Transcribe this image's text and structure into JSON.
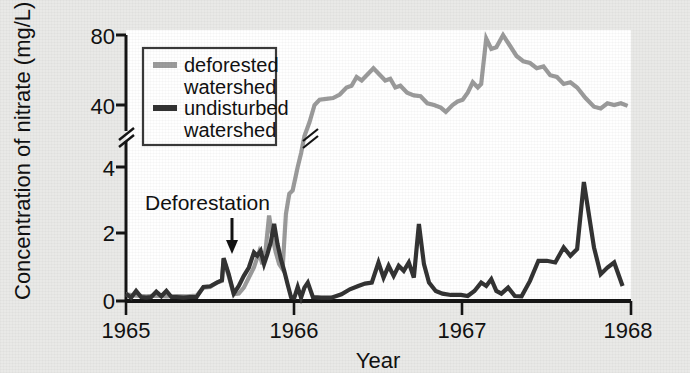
{
  "chart_data": {
    "type": "line",
    "title": "",
    "xlabel": "Year",
    "ylabel": "Concentration of nitrate (mg/L)",
    "xlim": [
      1965,
      1968
    ],
    "xticks": [
      1965,
      1966,
      1967,
      1968
    ],
    "xticklabels": [
      "1965",
      "1966",
      "1967",
      "1968"
    ],
    "yticks_lower": [
      0,
      2,
      4
    ],
    "yticklabels_lower": [
      "0",
      "2",
      "4"
    ],
    "yticks_upper": [
      40,
      80
    ],
    "yticklabels_upper": [
      "40",
      "80"
    ],
    "y_axis_break": true,
    "y_break_note": "axis broken between 4 and 40 mg/L",
    "grid": false,
    "legend_position": "upper-left-inside",
    "annotations": [
      {
        "text": "Deforestation",
        "x": 1965.58,
        "y": 2.85,
        "arrow_to_x": 1965.6,
        "arrow_to_y": 1.3
      }
    ],
    "series": [
      {
        "name": "deforested watershed",
        "color": "#9b9b9b",
        "legend_label_line1": "deforested",
        "legend_label_line2": "watershed",
        "points": [
          [
            1965.0,
            0.2
          ],
          [
            1965.06,
            0.16
          ],
          [
            1965.12,
            0.14
          ],
          [
            1965.18,
            0.16
          ],
          [
            1965.24,
            0.14
          ],
          [
            1965.3,
            0.15
          ],
          [
            1965.36,
            0.14
          ],
          [
            1965.42,
            0.16
          ],
          [
            1965.46,
            0.4
          ],
          [
            1965.5,
            0.42
          ],
          [
            1965.54,
            0.55
          ],
          [
            1965.57,
            0.6
          ],
          [
            1965.58,
            1.25
          ],
          [
            1965.61,
            0.75
          ],
          [
            1965.64,
            0.2
          ],
          [
            1965.67,
            0.22
          ],
          [
            1965.7,
            0.4
          ],
          [
            1965.73,
            0.7
          ],
          [
            1965.76,
            1.0
          ],
          [
            1965.79,
            1.45
          ],
          [
            1965.81,
            1.1
          ],
          [
            1965.83,
            1.55
          ],
          [
            1965.85,
            2.55
          ],
          [
            1965.87,
            1.9
          ],
          [
            1965.89,
            1.45
          ],
          [
            1965.91,
            1.1
          ],
          [
            1965.93,
            0.95
          ],
          [
            1965.95,
            2.6
          ],
          [
            1965.97,
            3.2
          ],
          [
            1965.99,
            3.3
          ],
          [
            1966.02,
            4.0
          ],
          [
            1966.04,
            12.0
          ],
          [
            1966.06,
            22.0
          ],
          [
            1966.09,
            30.0
          ],
          [
            1966.12,
            40.0
          ],
          [
            1966.15,
            43.0
          ],
          [
            1966.19,
            43.5
          ],
          [
            1966.23,
            44.0
          ],
          [
            1966.27,
            46.0
          ],
          [
            1966.31,
            50.0
          ],
          [
            1966.34,
            51.0
          ],
          [
            1966.37,
            56.0
          ],
          [
            1966.4,
            54.0
          ],
          [
            1966.44,
            58.0
          ],
          [
            1966.47,
            61.0
          ],
          [
            1966.51,
            57.0
          ],
          [
            1966.54,
            54.0
          ],
          [
            1966.57,
            55.0
          ],
          [
            1966.6,
            50.0
          ],
          [
            1966.63,
            51.0
          ],
          [
            1966.67,
            47.0
          ],
          [
            1966.71,
            45.5
          ],
          [
            1966.75,
            45.0
          ],
          [
            1966.79,
            41.0
          ],
          [
            1966.83,
            40.0
          ],
          [
            1966.87,
            38.5
          ],
          [
            1966.9,
            36.0
          ],
          [
            1966.94,
            40.0
          ],
          [
            1966.97,
            42.0
          ],
          [
            1967.0,
            43.0
          ],
          [
            1967.03,
            47.0
          ],
          [
            1967.06,
            53.0
          ],
          [
            1967.09,
            50.0
          ],
          [
            1967.11,
            52.0
          ],
          [
            1967.14,
            78.0
          ],
          [
            1967.17,
            72.0
          ],
          [
            1967.2,
            73.0
          ],
          [
            1967.24,
            80.0
          ],
          [
            1967.28,
            74.0
          ],
          [
            1967.32,
            68.0
          ],
          [
            1967.36,
            65.0
          ],
          [
            1967.4,
            64.0
          ],
          [
            1967.44,
            61.0
          ],
          [
            1967.48,
            62.0
          ],
          [
            1967.52,
            57.0
          ],
          [
            1967.56,
            56.0
          ],
          [
            1967.6,
            52.0
          ],
          [
            1967.64,
            53.0
          ],
          [
            1967.68,
            50.0
          ],
          [
            1967.73,
            44.0
          ],
          [
            1967.78,
            39.0
          ],
          [
            1967.82,
            38.0
          ],
          [
            1967.86,
            41.0
          ],
          [
            1967.9,
            40.0
          ],
          [
            1967.94,
            41.0
          ],
          [
            1967.98,
            39.5
          ]
        ]
      },
      {
        "name": "undisturbed watershed",
        "color": "#333333",
        "legend_label_line1": "undisturbed",
        "legend_label_line2": "watershed",
        "points": [
          [
            1965.0,
            0.22
          ],
          [
            1965.03,
            0.1
          ],
          [
            1965.06,
            0.3
          ],
          [
            1965.09,
            0.12
          ],
          [
            1965.12,
            0.1
          ],
          [
            1965.15,
            0.12
          ],
          [
            1965.18,
            0.28
          ],
          [
            1965.21,
            0.14
          ],
          [
            1965.24,
            0.3
          ],
          [
            1965.27,
            0.12
          ],
          [
            1965.3,
            0.12
          ],
          [
            1965.34,
            0.1
          ],
          [
            1965.38,
            0.12
          ],
          [
            1965.42,
            0.12
          ],
          [
            1965.46,
            0.42
          ],
          [
            1965.5,
            0.44
          ],
          [
            1965.54,
            0.55
          ],
          [
            1965.57,
            0.62
          ],
          [
            1965.58,
            1.28
          ],
          [
            1965.61,
            0.8
          ],
          [
            1965.64,
            0.22
          ],
          [
            1965.67,
            0.45
          ],
          [
            1965.7,
            0.75
          ],
          [
            1965.73,
            1.0
          ],
          [
            1965.76,
            1.45
          ],
          [
            1965.78,
            1.35
          ],
          [
            1965.8,
            1.5
          ],
          [
            1965.82,
            1.1
          ],
          [
            1965.84,
            1.4
          ],
          [
            1965.86,
            1.75
          ],
          [
            1965.88,
            2.3
          ],
          [
            1965.9,
            1.7
          ],
          [
            1965.92,
            1.25
          ],
          [
            1965.94,
            0.9
          ],
          [
            1965.96,
            0.5
          ],
          [
            1965.98,
            0.12
          ],
          [
            1966.0,
            0.1
          ],
          [
            1966.02,
            0.42
          ],
          [
            1966.04,
            0.1
          ],
          [
            1966.06,
            0.4
          ],
          [
            1966.08,
            0.55
          ],
          [
            1966.11,
            0.12
          ],
          [
            1966.16,
            0.1
          ],
          [
            1966.22,
            0.1
          ],
          [
            1966.28,
            0.2
          ],
          [
            1966.33,
            0.35
          ],
          [
            1966.38,
            0.45
          ],
          [
            1966.42,
            0.52
          ],
          [
            1966.46,
            0.55
          ],
          [
            1966.5,
            1.15
          ],
          [
            1966.53,
            0.7
          ],
          [
            1966.56,
            1.05
          ],
          [
            1966.59,
            0.75
          ],
          [
            1966.62,
            1.05
          ],
          [
            1966.65,
            0.9
          ],
          [
            1966.68,
            1.15
          ],
          [
            1966.71,
            0.7
          ],
          [
            1966.74,
            2.3
          ],
          [
            1966.77,
            1.1
          ],
          [
            1966.8,
            0.55
          ],
          [
            1966.84,
            0.3
          ],
          [
            1966.88,
            0.22
          ],
          [
            1966.93,
            0.18
          ],
          [
            1966.99,
            0.18
          ],
          [
            1967.03,
            0.15
          ],
          [
            1967.07,
            0.3
          ],
          [
            1967.11,
            0.55
          ],
          [
            1967.14,
            0.45
          ],
          [
            1967.17,
            0.65
          ],
          [
            1967.2,
            0.3
          ],
          [
            1967.23,
            0.22
          ],
          [
            1967.27,
            0.4
          ],
          [
            1967.31,
            0.15
          ],
          [
            1967.35,
            0.14
          ],
          [
            1967.4,
            0.6
          ],
          [
            1967.45,
            1.2
          ],
          [
            1967.5,
            1.2
          ],
          [
            1967.55,
            1.15
          ],
          [
            1967.6,
            1.6
          ],
          [
            1967.64,
            1.35
          ],
          [
            1967.68,
            1.55
          ],
          [
            1967.72,
            3.55
          ],
          [
            1967.78,
            1.6
          ],
          [
            1967.82,
            0.8
          ],
          [
            1967.86,
            1.0
          ],
          [
            1967.9,
            1.15
          ],
          [
            1967.95,
            0.45
          ]
        ]
      }
    ]
  },
  "axis": {
    "ylabel": "Concentration of nitrate (mg/L)",
    "xlabel": "Year"
  },
  "legend": {
    "deforested_line1": "deforested",
    "deforested_line2": "watershed",
    "undisturbed_line1": "undisturbed",
    "undisturbed_line2": "watershed"
  },
  "annotation": {
    "deforestation": "Deforestation"
  },
  "ticks": {
    "y": [
      "80",
      "40",
      "4",
      "2",
      "0"
    ],
    "x": [
      "1965",
      "1966",
      "1967",
      "1968"
    ]
  },
  "colors": {
    "deforested": "#9b9b9b",
    "undisturbed": "#333333",
    "axis": "#141414",
    "page_bg": "#e9e9e7",
    "plot_bg": "#ffffff"
  }
}
